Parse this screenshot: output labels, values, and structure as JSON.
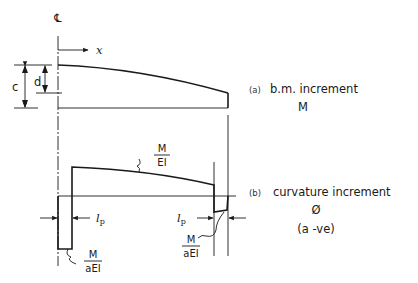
{
  "diagram": {
    "centerline_symbol": "℄",
    "x_axis_label": "x",
    "dimensions": {
      "c": "c",
      "d": "d"
    },
    "panel_a": {
      "tag": "(a)",
      "title": "b.m. increment",
      "symbol": "M"
    },
    "panel_b": {
      "tag": "(b)",
      "title": "curvature increment",
      "symbol": "Ø",
      "note": "(a -ve)"
    },
    "annotations": {
      "m_over_ei": {
        "num": "M",
        "den": "EI"
      },
      "m_over_aei_left": {
        "num": "M",
        "den": "aEI"
      },
      "m_over_aei_right": {
        "num": "M",
        "den": "aEI"
      },
      "lp_left": {
        "main": "l",
        "sub": "p"
      },
      "lp_right": {
        "main": "l",
        "sub": "p"
      }
    }
  }
}
